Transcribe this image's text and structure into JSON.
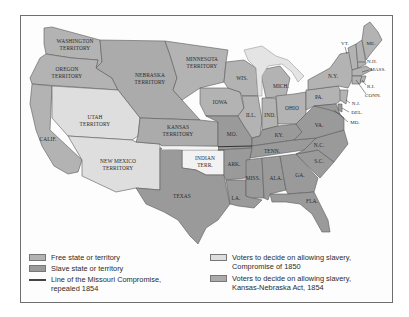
{
  "colors": {
    "free": "#b3b3b3",
    "slave": "#9a9a9a",
    "compromise_1850": "#dedede",
    "kansas_nebraska": "#ababab",
    "indian": "#f2f2f2",
    "lakes": "#e4e4e4",
    "border": "#5a5a5a"
  },
  "regions": {
    "washington": "WASHINGTON",
    "washington2": "TERRITORY",
    "oregon": "OREGON",
    "oregon2": "TERRITORY",
    "nebraska": "NEBRASKA",
    "nebraska2": "TERRITORY",
    "minnesota": "MINNESOTA",
    "minnesota2": "TERRITORY",
    "utah": "UTAH",
    "utah2": "TERRITORY",
    "kansas": "KANSAS",
    "kansas2": "TERRITORY",
    "newmexico": "NEW MEXICO",
    "newmexico2": "TERRITORY",
    "indian": "INDIAN",
    "indian2": "TERR.",
    "calif": "CALIF.",
    "texas": "TEXAS",
    "wis": "WIS.",
    "mich": "MICH.",
    "iowa": "IOWA",
    "ill": "ILL.",
    "ind": "IND.",
    "ohio": "OHIO",
    "mo": "MO.",
    "ky": "KY.",
    "ark": "ARK.",
    "tenn": "TENN.",
    "la": "LA.",
    "miss": "MISS.",
    "ala": "ALA.",
    "ga": "GA.",
    "fla": "FLA.",
    "sc": "S.C.",
    "nc": "N.C.",
    "va": "VA.",
    "pa": "PA.",
    "ny": "N.Y.",
    "vt": "VT.",
    "me": "ME.",
    "nh": "N.H.",
    "mass": "MASS.",
    "ri": "R.I.",
    "conn": "CONN.",
    "nj": "N.J.",
    "del": "DEL.",
    "md": "MD."
  },
  "legend": {
    "free": "Free state or territory",
    "slave": "Slave state or territory",
    "missouri_line_1": "Line of the Missouri Compromise,",
    "missouri_line_2": "repealed 1854",
    "compromise_1": "Voters to decide on allowing slavery,",
    "compromise_2": "Compromise of 1850",
    "kn_1": "Voters to decide on allowing slavery,",
    "kn_2": "Kansas-Nebraska Act, 1854"
  }
}
